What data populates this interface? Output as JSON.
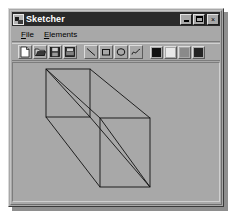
{
  "window": {
    "title": "Sketcher",
    "icon": "sketcher-app-icon",
    "controls": {
      "minimize_label": "",
      "maximize_label": "",
      "close_label": "×"
    }
  },
  "menubar": {
    "items": [
      {
        "label": "File",
        "mnemonic": "F",
        "rest": "ile"
      },
      {
        "label": "Elements",
        "mnemonic": "E",
        "rest": "lements"
      }
    ]
  },
  "toolbar": {
    "file_tools": [
      {
        "name": "new-document-tool",
        "title": "New"
      },
      {
        "name": "open-folder-tool",
        "title": "Open"
      },
      {
        "name": "save-tool",
        "title": "Save"
      },
      {
        "name": "print-tool",
        "title": "Print"
      }
    ],
    "draw_tools": [
      {
        "name": "line-tool",
        "title": "Line"
      },
      {
        "name": "rectangle-tool",
        "title": "Rectangle"
      },
      {
        "name": "circle-tool",
        "title": "Circle"
      },
      {
        "name": "curve-tool",
        "title": "Curve"
      }
    ],
    "color_swatches": [
      {
        "name": "color-black",
        "color": "#101010"
      },
      {
        "name": "color-white",
        "color": "#e8e8e8"
      },
      {
        "name": "color-gray",
        "color": "#8a8a8a"
      },
      {
        "name": "color-dark",
        "color": "#242424"
      }
    ]
  },
  "canvas": {
    "caption": "Lines and rectangles",
    "background_color": "#a8a8a8",
    "stroke_color": "#101010",
    "drawing": {
      "type": "wireframe-box",
      "back_rect": {
        "x": 33,
        "y": 6,
        "w": 44,
        "h": 48
      },
      "front_rect": {
        "x": 87,
        "y": 55,
        "w": 50,
        "h": 69
      },
      "connectors": [
        {
          "x1": 33,
          "y1": 6,
          "x2": 87,
          "y2": 55
        },
        {
          "x1": 77,
          "y1": 6,
          "x2": 137,
          "y2": 55
        },
        {
          "x1": 33,
          "y1": 54,
          "x2": 87,
          "y2": 124
        },
        {
          "x1": 77,
          "y1": 54,
          "x2": 137,
          "y2": 124
        }
      ],
      "diagonals": [
        {
          "x1": 33,
          "y1": 6,
          "x2": 77,
          "y2": 54
        },
        {
          "x1": 87,
          "y1": 55,
          "x2": 137,
          "y2": 124
        }
      ]
    }
  }
}
